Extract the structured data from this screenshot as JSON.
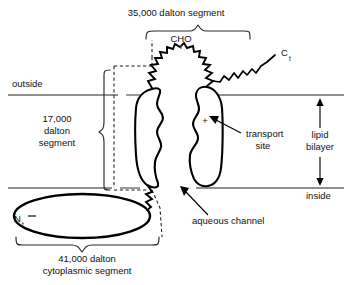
{
  "figure": {
    "title_top": "35,000 dalton segment",
    "background_color": "#ffffff",
    "ink_color": "#000000",
    "membrane_line_color": "#6b6b6b"
  },
  "labels": {
    "top_segment": "35,000 dalton segment",
    "cho": "CHO",
    "c_terminus_main": "C",
    "c_terminus_sub": "t",
    "n_terminus_main": "N",
    "n_terminus_sub": "t",
    "outside": "outside",
    "inside": "inside",
    "left_segment_line1": "17,000",
    "left_segment_line2": "dalton",
    "left_segment_line3": "segment",
    "transport_line1": "transport",
    "transport_line2": "site",
    "aqueous_channel": "aqueous channel",
    "lipid_line1": "lipid",
    "lipid_line2": "bilayer",
    "bottom_segment_line1": "41,000 dalton",
    "bottom_segment_line2": "cytoplasmic segment",
    "charge_symbol": "+"
  },
  "icons": {
    "transport_leader": "arrow-pointer-icon",
    "channel_leader": "arrow-pointer-icon",
    "bilayer_up": "arrow-up-icon",
    "bilayer_down": "arrow-down-icon",
    "top_brace": "curly-brace-down-icon",
    "left_brace": "curly-brace-right-icon",
    "bottom_brace": "curly-brace-up-icon",
    "glycosylation_loop": "sawtooth-loop-icon",
    "c_tail": "zigzag-tail-icon"
  },
  "geometry": {
    "outer_membrane_y": 95,
    "inner_membrane_y": 188,
    "canvas_width": 352,
    "canvas_height": 285
  }
}
